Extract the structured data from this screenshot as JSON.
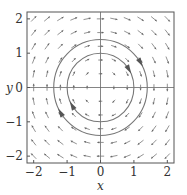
{
  "chart_data": {
    "type": "quiver",
    "title": "",
    "xlabel": "x",
    "ylabel": "y",
    "xlim": [
      -2.2,
      2.2
    ],
    "ylim": [
      -2.2,
      2.2
    ],
    "xticks": [
      "-2",
      "-1",
      "0",
      "1",
      "2"
    ],
    "yticks": [
      "-2",
      "-1",
      "0",
      "1",
      "2"
    ],
    "field": {
      "dx": "y",
      "dy": "-x",
      "direction": "clockwise"
    },
    "trajectories": [
      {
        "shape": "circle",
        "radius": 1.0
      },
      {
        "shape": "circle",
        "radius": 1.4
      }
    ],
    "grid": false
  },
  "axes": {
    "xlabel": "x",
    "ylabel": "y"
  }
}
